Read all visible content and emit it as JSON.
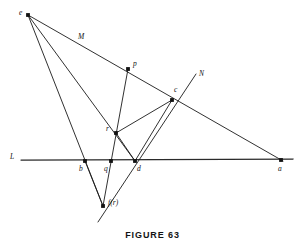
{
  "figure": {
    "caption": "FIGURE 63",
    "type": "geometric-construction-diagram",
    "canvas": {
      "width": 305,
      "height": 248
    },
    "stroke_color": "#1a1a1a",
    "background_color": "#ffffff",
    "points": [
      {
        "id": "e",
        "label": "e",
        "x": 28,
        "y": 15,
        "label_x": 19,
        "label_y": 9,
        "dot": true
      },
      {
        "id": "p",
        "label": "p",
        "x": 128,
        "y": 69,
        "label_x": 133,
        "label_y": 60,
        "dot": true
      },
      {
        "id": "c",
        "label": "c",
        "x": 172,
        "y": 100,
        "label_x": 174,
        "label_y": 86,
        "dot": true
      },
      {
        "id": "r",
        "label": "r",
        "x": 116,
        "y": 133,
        "label_x": 106,
        "label_y": 125,
        "dot": true
      },
      {
        "id": "b",
        "label": "b",
        "x": 85,
        "y": 161,
        "label_x": 79,
        "label_y": 165,
        "dot": true
      },
      {
        "id": "q",
        "label": "q",
        "x": 111,
        "y": 161,
        "label_x": 104,
        "label_y": 165,
        "dot": true
      },
      {
        "id": "d",
        "label": "d",
        "x": 135,
        "y": 161,
        "label_x": 137,
        "label_y": 165,
        "dot": true
      },
      {
        "id": "a",
        "label": "a",
        "x": 281,
        "y": 160,
        "label_x": 278,
        "label_y": 165,
        "dot": true
      },
      {
        "id": "fr",
        "label": "f(r)",
        "x": 103,
        "y": 206,
        "label_x": 108,
        "label_y": 199,
        "dot": true
      }
    ],
    "line_labels": [
      {
        "id": "M",
        "label": "M",
        "label_x": 78,
        "label_y": 33
      },
      {
        "id": "N",
        "label": "N",
        "label_x": 199,
        "label_y": 70
      },
      {
        "id": "L",
        "label": "L",
        "label_x": 10,
        "label_y": 153
      }
    ],
    "segments": [
      {
        "id": "line-M-e-to-a",
        "x1": 28,
        "y1": 15,
        "x2": 283,
        "y2": 161,
        "style": "thin"
      },
      {
        "id": "line-e-to-r-d",
        "x1": 28,
        "y1": 15,
        "x2": 135,
        "y2": 161,
        "style": "thin"
      },
      {
        "id": "line-e-to-b-fr",
        "x1": 28,
        "y1": 15,
        "x2": 103,
        "y2": 206,
        "style": "thin"
      },
      {
        "id": "line-L",
        "x1": 21,
        "y1": 160,
        "x2": 293,
        "y2": 159,
        "style": "thick"
      },
      {
        "id": "line-N-fr-to-N",
        "x1": 98,
        "y1": 222,
        "x2": 196,
        "y2": 74,
        "style": "thin"
      },
      {
        "id": "line-p-to-q-fr",
        "x1": 128,
        "y1": 69,
        "x2": 103,
        "y2": 206,
        "style": "thin"
      },
      {
        "id": "line-r-to-c",
        "x1": 116,
        "y1": 133,
        "x2": 172,
        "y2": 100,
        "style": "thin"
      },
      {
        "id": "line-c-to-d",
        "x1": 172,
        "y1": 100,
        "x2": 135,
        "y2": 161,
        "style": "thin"
      },
      {
        "id": "line-r-to-d",
        "x1": 116,
        "y1": 133,
        "x2": 135,
        "y2": 161,
        "style": "thin"
      },
      {
        "id": "line-b-to-fr",
        "x1": 85,
        "y1": 161,
        "x2": 103,
        "y2": 206,
        "style": "thin"
      }
    ]
  }
}
